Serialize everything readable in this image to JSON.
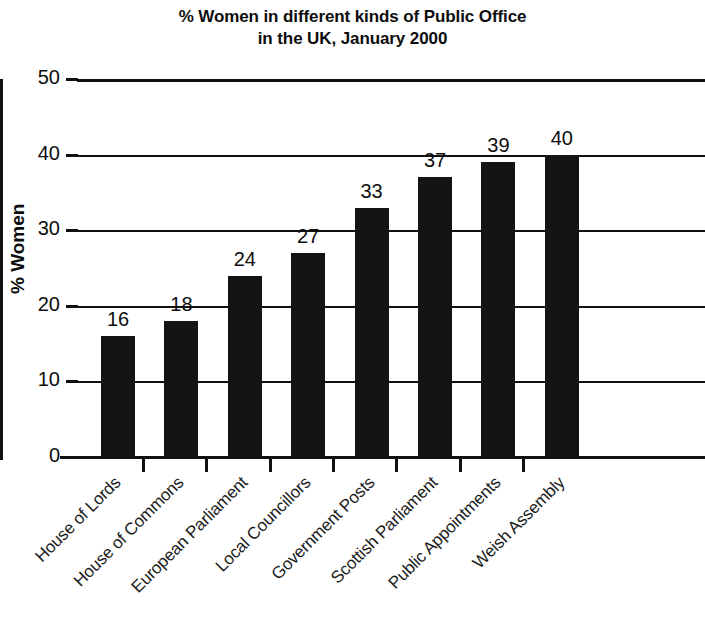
{
  "chart_data": {
    "type": "bar",
    "title": "% Women in different kinds of Public Office in the UK, January 2000",
    "title_lines": [
      "% Women in different kinds of Public Office",
      "in the UK, January 2000"
    ],
    "xlabel": "",
    "ylabel": "% Women",
    "categories": [
      "House of Lords",
      "House of Commons",
      "European Parliament",
      "Local Councillors",
      "Government Posts",
      "Scottish Parliament",
      "Public Appointments",
      "Weish Assembly"
    ],
    "values": [
      16,
      18,
      24,
      27,
      33,
      37,
      39,
      40
    ],
    "value_labels": [
      "16",
      "18",
      "24",
      "27",
      "33",
      "37",
      "39",
      "40"
    ],
    "ylim": [
      0,
      50
    ],
    "ytick_values": [
      0,
      10,
      20,
      30,
      40,
      50
    ],
    "ytick_labels": [
      "0",
      "10",
      "20",
      "30",
      "40",
      "50"
    ],
    "grid": "horizontal",
    "legend": "none",
    "bar_color": "#141414",
    "axis_color": "#111111",
    "background": "#ffffff"
  }
}
